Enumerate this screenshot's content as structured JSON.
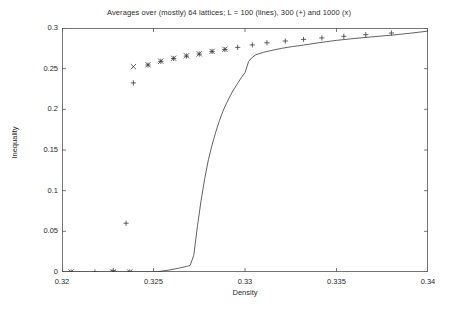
{
  "chart_data": {
    "type": "line",
    "title": "Averages over (mostly) 64 lattices; L = 100 (lines), 300 (+) and 1000 (x)",
    "xlabel": "Density",
    "ylabel": "Inequality",
    "xlim": [
      0.32,
      0.34
    ],
    "ylim": [
      0,
      0.3
    ],
    "xticks": [
      0.32,
      0.325,
      0.33,
      0.335,
      0.34
    ],
    "xtick_labels": [
      "0.32",
      "0.325",
      "0.33",
      "0.335",
      "0.34"
    ],
    "yticks": [
      0,
      0.05,
      0.1,
      0.15,
      0.2,
      0.25,
      0.3
    ],
    "ytick_labels": [
      "0",
      "0.05",
      "0.1",
      "0.15",
      "0.2",
      "0.25",
      "0.3"
    ],
    "grid": false,
    "legend_position": "none",
    "series": [
      {
        "name": "L = 100 (lines)",
        "marker": "line",
        "style": "solid",
        "color": "#3a3a3a",
        "x": [
          0.32,
          0.323,
          0.325,
          0.3252,
          0.3258,
          0.3264,
          0.3268,
          0.327,
          0.3272,
          0.3274,
          0.3276,
          0.3278,
          0.328,
          0.3282,
          0.3284,
          0.3286,
          0.3288,
          0.329,
          0.3292,
          0.3294,
          0.3296,
          0.3298,
          0.33,
          0.3302,
          0.3304,
          0.3306,
          0.331,
          0.3314,
          0.332,
          0.3326,
          0.3332,
          0.334,
          0.335,
          0.336,
          0.337,
          0.338,
          0.339,
          0.34
        ],
        "y": [
          0.0,
          0.0,
          0.0,
          0.0004,
          0.0022,
          0.0048,
          0.0068,
          0.008,
          0.0205,
          0.056,
          0.088,
          0.115,
          0.138,
          0.156,
          0.172,
          0.186,
          0.198,
          0.208,
          0.217,
          0.225,
          0.232,
          0.239,
          0.245,
          0.259,
          0.264,
          0.2672,
          0.27,
          0.2722,
          0.275,
          0.2772,
          0.279,
          0.2818,
          0.2848,
          0.2872,
          0.2892,
          0.2912,
          0.2935,
          0.2962
        ]
      },
      {
        "name": "L = 300 (+)",
        "marker": "plus",
        "color": "#3a3a3a",
        "x": [
          0.3205,
          0.3218,
          0.3228,
          0.3237,
          0.3235,
          0.3239,
          0.3247,
          0.3254,
          0.3261,
          0.3268,
          0.3275,
          0.3282,
          0.3289,
          0.3296,
          0.3304,
          0.3312,
          0.3322,
          0.3332,
          0.3342,
          0.3354,
          0.3366,
          0.338
        ],
        "y": [
          0.0,
          0.0,
          0.002,
          0.0,
          0.06,
          0.2325,
          0.2545,
          0.259,
          0.2625,
          0.2655,
          0.268,
          0.2712,
          0.2735,
          0.2762,
          0.2792,
          0.2818,
          0.284,
          0.286,
          0.2878,
          0.2898,
          0.2918,
          0.2938
        ]
      },
      {
        "name": "L = 1000 (x)",
        "marker": "cross",
        "color": "#3a3a3a",
        "x": [
          0.3205,
          0.3228,
          0.3237,
          0.3239,
          0.3247,
          0.3254,
          0.3261,
          0.3268,
          0.3275,
          0.3282,
          0.3289
        ],
        "y": [
          0.0,
          0.0,
          0.0,
          0.2525,
          0.2548,
          0.2592,
          0.2628,
          0.2658,
          0.2682,
          0.2712,
          0.2738
        ]
      }
    ]
  }
}
